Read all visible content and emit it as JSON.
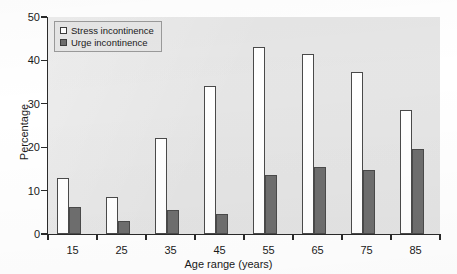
{
  "chart_data": {
    "type": "bar",
    "title": "",
    "xlabel": "Age range (years)",
    "ylabel": "Percentage",
    "categories": [
      "15",
      "25",
      "35",
      "45",
      "55",
      "65",
      "75",
      "85"
    ],
    "series": [
      {
        "name": "Stress incontinence",
        "color": "#ffffff",
        "values": [
          13.0,
          8.5,
          22.2,
          34.1,
          43.0,
          41.4,
          37.4,
          28.5
        ]
      },
      {
        "name": "Urge incontinence",
        "color": "#6e6e6e",
        "values": [
          6.3,
          2.9,
          5.5,
          4.7,
          13.5,
          15.5,
          14.8,
          19.5
        ]
      }
    ],
    "ylim": [
      0,
      50
    ],
    "yticks": [
      0,
      10,
      20,
      30,
      40,
      50
    ],
    "xticks": [
      "15",
      "25",
      "35",
      "45",
      "55",
      "65",
      "75",
      "85"
    ],
    "grid": false,
    "legend_position": "top-left",
    "plot_background": "#e6e6e6",
    "axis_color": "#2a2a2a"
  },
  "legend": {
    "items": [
      {
        "label": "Stress incontinence",
        "swatch": "stress"
      },
      {
        "label": "Urge incontinence",
        "swatch": "urge"
      }
    ]
  }
}
